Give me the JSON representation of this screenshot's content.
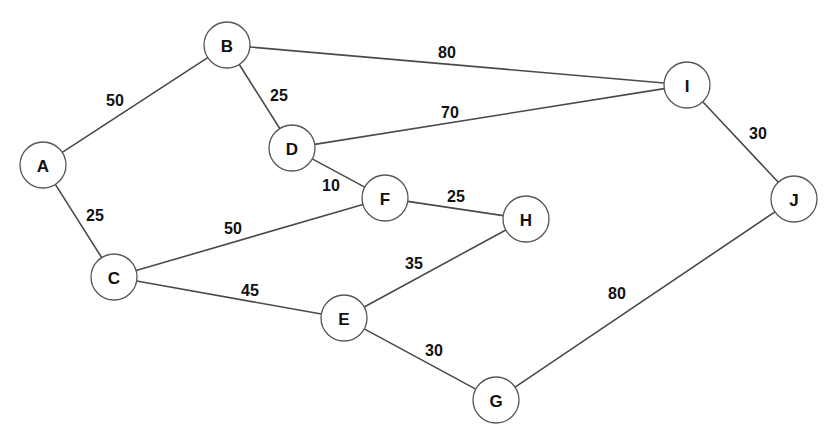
{
  "diagram": {
    "background_color": "#ffffff",
    "node_fill_color": "#ffffff",
    "node_stroke_color": "#565656",
    "edge_color": "#4a4a4a",
    "label_color": "#111111",
    "node_radius": 23
  },
  "chart_data": {
    "type": "diagram",
    "nodes": [
      {
        "id": "A",
        "label": "A",
        "x": 43,
        "y": 165
      },
      {
        "id": "B",
        "label": "B",
        "x": 227,
        "y": 45
      },
      {
        "id": "C",
        "label": "C",
        "x": 114,
        "y": 277
      },
      {
        "id": "D",
        "label": "D",
        "x": 292,
        "y": 148
      },
      {
        "id": "E",
        "label": "E",
        "x": 344,
        "y": 318
      },
      {
        "id": "F",
        "label": "F",
        "x": 385,
        "y": 198
      },
      {
        "id": "G",
        "label": "G",
        "x": 496,
        "y": 400
      },
      {
        "id": "H",
        "label": "H",
        "x": 526,
        "y": 219
      },
      {
        "id": "I",
        "label": "I",
        "x": 687,
        "y": 85
      },
      {
        "id": "J",
        "label": "J",
        "x": 794,
        "y": 199
      }
    ],
    "edges": [
      {
        "from": "A",
        "to": "B",
        "weight": "50",
        "lx": 115,
        "ly": 100
      },
      {
        "from": "A",
        "to": "C",
        "weight": "25",
        "lx": 95,
        "ly": 215
      },
      {
        "from": "B",
        "to": "D",
        "weight": "25",
        "lx": 279,
        "ly": 95
      },
      {
        "from": "B",
        "to": "I",
        "weight": "80",
        "lx": 447,
        "ly": 52
      },
      {
        "from": "D",
        "to": "I",
        "weight": "70",
        "lx": 450,
        "ly": 112
      },
      {
        "from": "D",
        "to": "F",
        "weight": "10",
        "lx": 331,
        "ly": 185
      },
      {
        "from": "C",
        "to": "F",
        "weight": "50",
        "lx": 233,
        "ly": 228
      },
      {
        "from": "C",
        "to": "E",
        "weight": "45",
        "lx": 250,
        "ly": 290
      },
      {
        "from": "F",
        "to": "H",
        "weight": "25",
        "lx": 456,
        "ly": 196
      },
      {
        "from": "E",
        "to": "H",
        "weight": "35",
        "lx": 414,
        "ly": 263
      },
      {
        "from": "E",
        "to": "G",
        "weight": "30",
        "lx": 434,
        "ly": 350
      },
      {
        "from": "G",
        "to": "J",
        "weight": "80",
        "lx": 617,
        "ly": 293
      },
      {
        "from": "I",
        "to": "J",
        "weight": "30",
        "lx": 758,
        "ly": 133
      }
    ]
  }
}
